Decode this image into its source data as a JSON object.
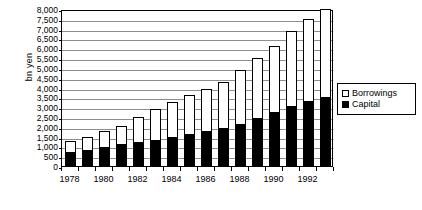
{
  "chart_data": {
    "type": "bar",
    "subtype": "stacked-vertical",
    "title": "",
    "xlabel": "",
    "ylabel": "bn yen",
    "ylim": [
      0,
      8000
    ],
    "ytick_step": 500,
    "grid": true,
    "legend_position": "right",
    "categories": [
      "1978",
      "1979",
      "1980",
      "1981",
      "1982",
      "1983",
      "1984",
      "1985",
      "1986",
      "1987",
      "1988",
      "1989",
      "1990",
      "1991",
      "1992",
      "1993"
    ],
    "xtick_labels": [
      "1978",
      "1980",
      "1982",
      "1984",
      "1986",
      "1988",
      "1990",
      "1992"
    ],
    "ytick_labels": [
      "0",
      "500",
      "1,000",
      "1,500",
      "2,000",
      "2,500",
      "3,000",
      "3,500",
      "4,000",
      "4,500",
      "5,000",
      "5,500",
      "6,000",
      "6,500",
      "7,000",
      "7,500",
      "8,000"
    ],
    "ytick_values": [
      0,
      500,
      1000,
      1500,
      2000,
      2500,
      3000,
      3500,
      4000,
      4500,
      5000,
      5500,
      6000,
      6500,
      7000,
      7500,
      8000
    ],
    "series": [
      {
        "name": "Capital",
        "color": "#000000",
        "values": [
          650,
          750,
          900,
          1050,
          1150,
          1300,
          1450,
          1600,
          1750,
          1900,
          2100,
          2400,
          2700,
          3000,
          3250,
          3450
        ]
      },
      {
        "name": "Borrowings",
        "color": "#ffffff",
        "values": [
          600,
          750,
          900,
          1000,
          1350,
          1600,
          1800,
          2000,
          2150,
          2400,
          2800,
          3100,
          3400,
          3900,
          4250,
          4550
        ]
      }
    ],
    "totals": [
      1250,
      1500,
      1800,
      2050,
      2500,
      2900,
      3250,
      3600,
      3900,
      4300,
      4900,
      5500,
      6100,
      6900,
      7500,
      8000
    ],
    "legend_entries": [
      {
        "label": "Borrowings",
        "swatch": "white"
      },
      {
        "label": "Capital",
        "swatch": "black"
      }
    ]
  }
}
